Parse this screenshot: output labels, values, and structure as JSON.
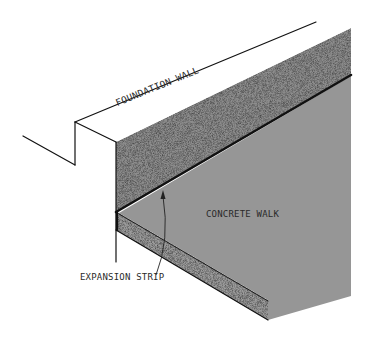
{
  "diagram": {
    "type": "isometric construction detail",
    "labels": {
      "foundation_wall": "FOUNDATION WALL",
      "concrete_walk": "CONCRETE WALK",
      "expansion_strip": "EXPANSION STRIP"
    },
    "colors": {
      "background": "#ffffff",
      "wall_face": "#8f8f8f",
      "walk_surface": "#969696",
      "slab_edge": "#9a9a9a",
      "line": "#111111",
      "text": "#2a2a2a"
    }
  }
}
